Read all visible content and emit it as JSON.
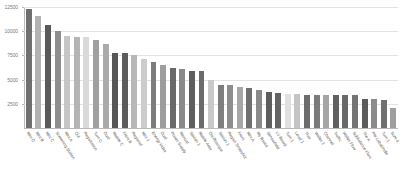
{
  "chart_data": {
    "type": "bar",
    "title": "",
    "subtitle": "",
    "xlabel": "",
    "ylabel": "",
    "ylim": [
      0,
      12500
    ],
    "yticks": [
      2500,
      5000,
      7500,
      10000,
      12500
    ],
    "ytick_labels": [
      "2500",
      "5000",
      "7500",
      "10000",
      "12500"
    ],
    "grid": true,
    "legend": "none",
    "orientation": "vertical",
    "categories": [
      "Mini D",
      "Mini B",
      "Mini C",
      "Screening Station",
      "Mini A",
      "Out",
      "Registration",
      "Turn C",
      "Dual",
      "Mobile C",
      "Front B",
      "Regional",
      "Mini J",
      "Energy Index",
      "Dual",
      "Power Supply",
      "Manual",
      "Station 1",
      "Mobile Area",
      "Oscilloscope",
      "Station 1",
      "Region Snapshot",
      "Front",
      "Mini A",
      "My Board",
      "Sensorfield",
      "LV Board",
      "Turn 1",
      "Level 1",
      "Thor",
      "Walter 1",
      "Channel",
      "Traffic",
      "Walter Flow",
      "Subbalance Flow",
      "The A",
      "Pre Labspindle",
      "Turn 1",
      "Sum 6"
    ],
    "values": [
      12300,
      11600,
      10650,
      10050,
      9550,
      9450,
      9400,
      9050,
      8700,
      7700,
      7700,
      7500,
      7100,
      6850,
      6550,
      6200,
      6050,
      5900,
      5850,
      5000,
      4400,
      4400,
      4200,
      4150,
      3900,
      3700,
      3650,
      3500,
      3500,
      3450,
      3400,
      3400,
      3400,
      3400,
      3400,
      3000,
      2950,
      2900,
      2100
    ],
    "bar_colors": [
      "#6f6f6f",
      "#b2b2b2",
      "#5a5a5a",
      "#8f8f8f",
      "#c6c6c6",
      "#b4b4b4",
      "#d9d9d9",
      "#a0a0a0",
      "#aaaaaa",
      "#575757",
      "#5c5c5c",
      "#b8b8b8",
      "#cccccc",
      "#7c7c7c",
      "#9d9d9d",
      "#6a6a6a",
      "#8a8a8a",
      "#5f5f5f",
      "#6b6b6b",
      "#c9c9c9",
      "#7e7e7e",
      "#8d8d8d",
      "#a7a7a7",
      "#707070",
      "#8a8a8a",
      "#5e5e5e",
      "#636363",
      "#e0e0e0",
      "#c4c4c4",
      "#6c6c6c",
      "#7b7b7b",
      "#a5a5a5",
      "#606060",
      "#686868",
      "#747474",
      "#5b5b5b",
      "#8b8b8b",
      "#707070",
      "#9e9e9e"
    ]
  },
  "axis": {
    "gridline_color": "#e3e3e3",
    "axis_color": "#b9b9b9",
    "tick_label_color": "#7a7a7a",
    "category_label_color": "#595959"
  }
}
